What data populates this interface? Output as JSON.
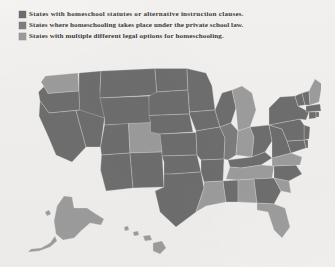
{
  "legend": {
    "items": [
      {
        "swatch_color": "#6d6d6d",
        "label": "States with homeschool statutes or alternative instruction clauses."
      },
      {
        "swatch_color": "#7e7e7e",
        "label": "States where homeschooling takes place under the private school law."
      },
      {
        "swatch_color": "#9b9b9b",
        "label": "States with multiple different legal options for homeschooling."
      }
    ]
  },
  "map": {
    "title": "United States homeschooling legal status choropleth",
    "background_color": "#f1f0ee",
    "border_color": "#e9e8e6",
    "category_colors": {
      "statute_or_alternative_instruction": "#6f6f6f",
      "private_school_law": "#7d7d7d",
      "multiple_legal_options": "#9d9d9d"
    },
    "states": [
      {
        "code": "WA",
        "name": "Washington",
        "category": "multiple_legal_options"
      },
      {
        "code": "OR",
        "name": "Oregon",
        "category": "statute_or_alternative_instruction"
      },
      {
        "code": "CA",
        "name": "California",
        "category": "statute_or_alternative_instruction"
      },
      {
        "code": "ID",
        "name": "Idaho",
        "category": "statute_or_alternative_instruction"
      },
      {
        "code": "NV",
        "name": "Nevada",
        "category": "statute_or_alternative_instruction"
      },
      {
        "code": "MT",
        "name": "Montana",
        "category": "statute_or_alternative_instruction"
      },
      {
        "code": "WY",
        "name": "Wyoming",
        "category": "statute_or_alternative_instruction"
      },
      {
        "code": "UT",
        "name": "Utah",
        "category": "statute_or_alternative_instruction"
      },
      {
        "code": "AZ",
        "name": "Arizona",
        "category": "statute_or_alternative_instruction"
      },
      {
        "code": "CO",
        "name": "Colorado",
        "category": "multiple_legal_options"
      },
      {
        "code": "NM",
        "name": "New Mexico",
        "category": "statute_or_alternative_instruction"
      },
      {
        "code": "ND",
        "name": "North Dakota",
        "category": "statute_or_alternative_instruction"
      },
      {
        "code": "SD",
        "name": "South Dakota",
        "category": "statute_or_alternative_instruction"
      },
      {
        "code": "NE",
        "name": "Nebraska",
        "category": "statute_or_alternative_instruction"
      },
      {
        "code": "KS",
        "name": "Kansas",
        "category": "statute_or_alternative_instruction"
      },
      {
        "code": "OK",
        "name": "Oklahoma",
        "category": "statute_or_alternative_instruction"
      },
      {
        "code": "TX",
        "name": "Texas",
        "category": "statute_or_alternative_instruction"
      },
      {
        "code": "MN",
        "name": "Minnesota",
        "category": "statute_or_alternative_instruction"
      },
      {
        "code": "IA",
        "name": "Iowa",
        "category": "statute_or_alternative_instruction"
      },
      {
        "code": "MO",
        "name": "Missouri",
        "category": "statute_or_alternative_instruction"
      },
      {
        "code": "AR",
        "name": "Arkansas",
        "category": "statute_or_alternative_instruction"
      },
      {
        "code": "LA",
        "name": "Louisiana",
        "category": "multiple_legal_options"
      },
      {
        "code": "WI",
        "name": "Wisconsin",
        "category": "statute_or_alternative_instruction"
      },
      {
        "code": "IL",
        "name": "Illinois",
        "category": "private_school_law"
      },
      {
        "code": "MS",
        "name": "Mississippi",
        "category": "statute_or_alternative_instruction"
      },
      {
        "code": "MI",
        "name": "Michigan",
        "category": "multiple_legal_options"
      },
      {
        "code": "IN",
        "name": "Indiana",
        "category": "multiple_legal_options"
      },
      {
        "code": "OH",
        "name": "Ohio",
        "category": "statute_or_alternative_instruction"
      },
      {
        "code": "KY",
        "name": "Kentucky",
        "category": "statute_or_alternative_instruction"
      },
      {
        "code": "TN",
        "name": "Tennessee",
        "category": "multiple_legal_options"
      },
      {
        "code": "AL",
        "name": "Alabama",
        "category": "multiple_legal_options"
      },
      {
        "code": "GA",
        "name": "Georgia",
        "category": "statute_or_alternative_instruction"
      },
      {
        "code": "FL",
        "name": "Florida",
        "category": "multiple_legal_options"
      },
      {
        "code": "SC",
        "name": "South Carolina",
        "category": "multiple_legal_options"
      },
      {
        "code": "NC",
        "name": "North Carolina",
        "category": "statute_or_alternative_instruction"
      },
      {
        "code": "VA",
        "name": "Virginia",
        "category": "multiple_legal_options"
      },
      {
        "code": "WV",
        "name": "West Virginia",
        "category": "statute_or_alternative_instruction"
      },
      {
        "code": "MD",
        "name": "Maryland",
        "category": "statute_or_alternative_instruction"
      },
      {
        "code": "DE",
        "name": "Delaware",
        "category": "statute_or_alternative_instruction"
      },
      {
        "code": "NJ",
        "name": "New Jersey",
        "category": "statute_or_alternative_instruction"
      },
      {
        "code": "PA",
        "name": "Pennsylvania",
        "category": "statute_or_alternative_instruction"
      },
      {
        "code": "NY",
        "name": "New York",
        "category": "statute_or_alternative_instruction"
      },
      {
        "code": "CT",
        "name": "Connecticut",
        "category": "statute_or_alternative_instruction"
      },
      {
        "code": "RI",
        "name": "Rhode Island",
        "category": "statute_or_alternative_instruction"
      },
      {
        "code": "MA",
        "name": "Massachusetts",
        "category": "statute_or_alternative_instruction"
      },
      {
        "code": "VT",
        "name": "Vermont",
        "category": "statute_or_alternative_instruction"
      },
      {
        "code": "NH",
        "name": "New Hampshire",
        "category": "statute_or_alternative_instruction"
      },
      {
        "code": "ME",
        "name": "Maine",
        "category": "multiple_legal_options"
      },
      {
        "code": "AK",
        "name": "Alaska",
        "category": "multiple_legal_options"
      },
      {
        "code": "HI",
        "name": "Hawaii",
        "category": "multiple_legal_options"
      }
    ]
  }
}
